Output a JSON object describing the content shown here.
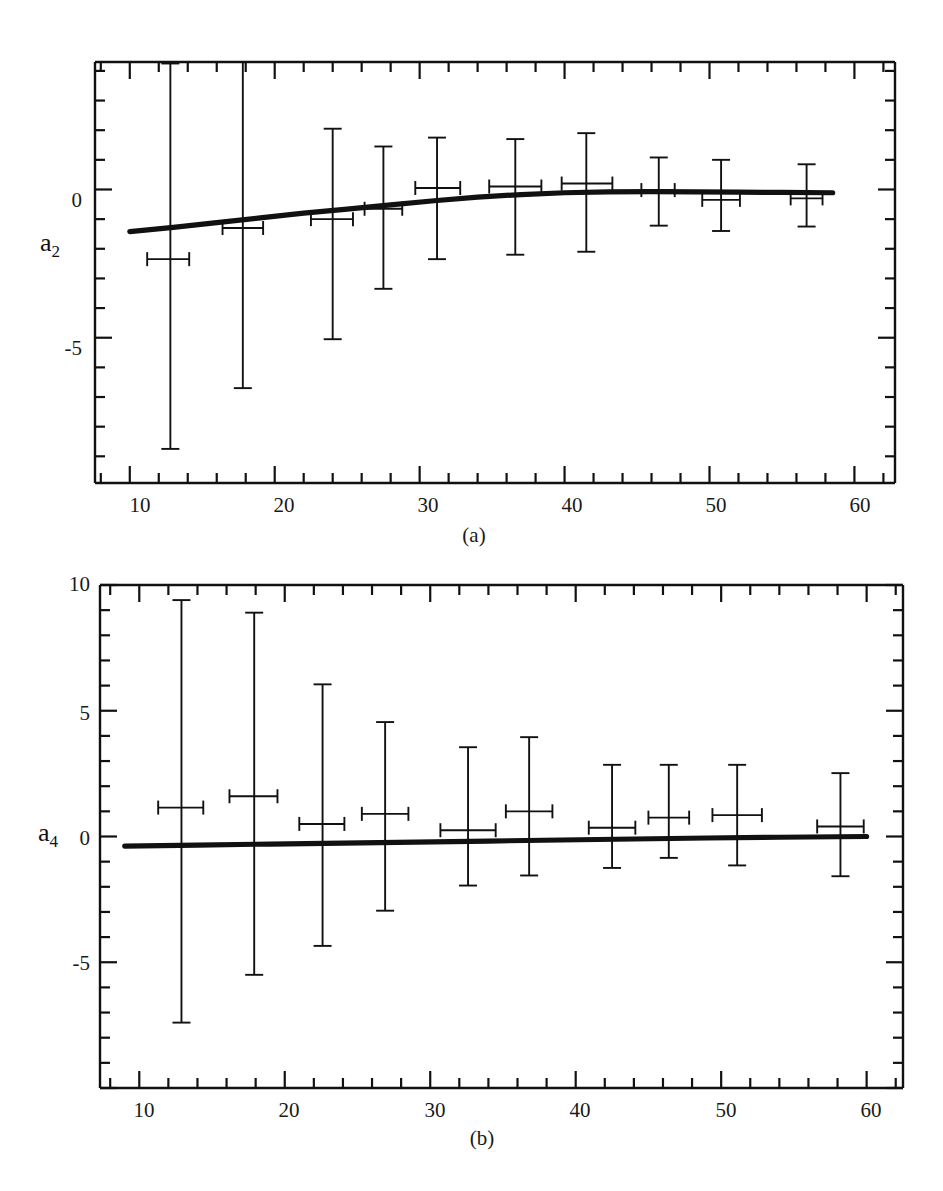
{
  "figure": {
    "background": "#ffffff",
    "ink": "#111111",
    "width": 943,
    "height": 1191
  },
  "panels": [
    {
      "id": "panel-a",
      "caption": "(a)",
      "ylabel": "a",
      "ylabel_sub": "2",
      "frame": {
        "left": 95,
        "top": 62,
        "right": 895,
        "bottom": 483
      },
      "x_axis": {
        "min": 7.6,
        "max": 62.8,
        "major_ticks": [
          10,
          20,
          30,
          40,
          50,
          60
        ],
        "major_tick_labels": [
          "10",
          "20",
          "30",
          "40",
          "50",
          "60"
        ],
        "minor_tick_step": 2
      },
      "y_axis": {
        "min": -9.9,
        "max": 4.3,
        "major_ticks": [
          0,
          -5
        ],
        "major_tick_labels": [
          "0",
          "-5"
        ],
        "minor_tick_step": 1
      }
    },
    {
      "id": "panel-b",
      "caption": "(b)",
      "ylabel": "a",
      "ylabel_sub": "4",
      "frame": {
        "left": 100,
        "top": 585,
        "right": 903,
        "bottom": 1088
      },
      "x_axis": {
        "min": 7.3,
        "max": 62.5,
        "major_ticks": [
          10,
          20,
          30,
          40,
          50,
          60
        ],
        "major_tick_labels": [
          "10",
          "20",
          "30",
          "40",
          "50",
          "60"
        ],
        "minor_tick_step": 2
      },
      "y_axis": {
        "min": -10.0,
        "max": 10.0,
        "major_ticks": [
          10,
          5,
          0,
          -5
        ],
        "major_tick_labels": [
          "10",
          "5",
          "0",
          "-5"
        ],
        "minor_tick_step": 1
      }
    }
  ],
  "chart_data": [
    {
      "type": "scatter",
      "id": "panel-a",
      "title": "",
      "subtitle": "(a)",
      "xlabel": "",
      "ylabel": "a2",
      "xlim": [
        7.6,
        62.8
      ],
      "ylim": [
        -9.9,
        4.3
      ],
      "grid": false,
      "legend": "none",
      "xticks": [
        10,
        20,
        30,
        40,
        50,
        60
      ],
      "yticks": [
        0,
        -5
      ],
      "series": [
        {
          "name": "measurements",
          "marker": "error-cross",
          "points": [
            {
              "x": 12.8,
              "y": -1.45,
              "xerr_lo": 1.6,
              "xerr_hi": 1.3,
              "yerr_lo": 7.3,
              "yerr_hi": 5.7,
              "xbar_y": -2.35
            },
            {
              "x": 17.8,
              "y": -1.2,
              "xerr_lo": 1.4,
              "xerr_hi": 1.4,
              "yerr_lo": 5.5,
              "yerr_hi": 5.5,
              "xbar_y": -1.3
            },
            {
              "x": 24.0,
              "y": -0.85,
              "xerr_lo": 1.5,
              "xerr_hi": 1.4,
              "yerr_lo": 4.2,
              "yerr_hi": 2.9,
              "xbar_y": -1.0
            },
            {
              "x": 27.5,
              "y": -0.55,
              "xerr_lo": 1.3,
              "xerr_hi": 1.3,
              "yerr_lo": 2.8,
              "yerr_hi": 2.0,
              "xbar_y": -0.65
            },
            {
              "x": 31.2,
              "y": 0.05,
              "xerr_lo": 1.5,
              "xerr_hi": 1.6,
              "yerr_lo": 2.4,
              "yerr_hi": 1.7,
              "xbar_y": 0.05
            },
            {
              "x": 36.6,
              "y": 0.1,
              "xerr_lo": 1.8,
              "xerr_hi": 1.8,
              "yerr_lo": 2.3,
              "yerr_hi": 1.6,
              "xbar_y": 0.1
            },
            {
              "x": 41.5,
              "y": 0.2,
              "xerr_lo": 1.7,
              "xerr_hi": 1.8,
              "yerr_lo": 2.3,
              "yerr_hi": 1.7,
              "xbar_y": 0.2
            },
            {
              "x": 46.5,
              "y": -0.02,
              "xerr_lo": 1.2,
              "xerr_hi": 1.1,
              "yerr_lo": 1.2,
              "yerr_hi": 1.1,
              "xbar_y": -0.02
            },
            {
              "x": 50.8,
              "y": -0.2,
              "xerr_lo": 1.3,
              "xerr_hi": 1.3,
              "yerr_lo": 1.2,
              "yerr_hi": 1.2,
              "xbar_y": -0.35
            },
            {
              "x": 56.7,
              "y": -0.15,
              "xerr_lo": 1.1,
              "xerr_hi": 1.1,
              "yerr_lo": 1.1,
              "yerr_hi": 1.0,
              "xbar_y": -0.3
            }
          ]
        },
        {
          "name": "model-fit",
          "marker": "thick-line",
          "x": [
            10.0,
            13.0,
            16.0,
            19.0,
            22.0,
            25.0,
            28.0,
            31.0,
            34.0,
            37.0,
            40.0,
            43.0,
            46.0,
            49.0,
            52.0,
            55.0,
            58.5
          ],
          "y": [
            -1.42,
            -1.28,
            -1.12,
            -0.96,
            -0.8,
            -0.66,
            -0.52,
            -0.38,
            -0.26,
            -0.17,
            -0.11,
            -0.08,
            -0.07,
            -0.08,
            -0.09,
            -0.1,
            -0.11
          ]
        }
      ]
    },
    {
      "type": "scatter",
      "id": "panel-b",
      "title": "",
      "subtitle": "(b)",
      "xlabel": "",
      "ylabel": "a4",
      "xlim": [
        7.3,
        62.5
      ],
      "ylim": [
        -10.0,
        10.0
      ],
      "grid": false,
      "legend": "none",
      "xticks": [
        10,
        20,
        30,
        40,
        50,
        60
      ],
      "yticks": [
        10,
        5,
        0,
        -5
      ],
      "series": [
        {
          "name": "measurements",
          "marker": "error-cross",
          "points": [
            {
              "x": 12.9,
              "y": 0.0,
              "xerr_lo": 1.6,
              "xerr_hi": 1.5,
              "yerr_lo": 7.4,
              "yerr_hi": 9.4,
              "xbar_y": 1.15
            },
            {
              "x": 17.9,
              "y": 0.0,
              "xerr_lo": 1.7,
              "xerr_hi": 1.6,
              "yerr_lo": 5.5,
              "yerr_hi": 8.9,
              "xbar_y": 1.6
            },
            {
              "x": 22.6,
              "y": 0.05,
              "xerr_lo": 1.6,
              "xerr_hi": 1.5,
              "yerr_lo": 4.4,
              "yerr_hi": 6.0,
              "xbar_y": 0.5
            },
            {
              "x": 26.9,
              "y": 0.05,
              "xerr_lo": 1.6,
              "xerr_hi": 1.6,
              "yerr_lo": 3.0,
              "yerr_hi": 4.5,
              "xbar_y": 0.9
            },
            {
              "x": 32.6,
              "y": 0.05,
              "xerr_lo": 1.9,
              "xerr_hi": 1.9,
              "yerr_lo": 2.0,
              "yerr_hi": 3.5,
              "xbar_y": 0.25
            },
            {
              "x": 36.8,
              "y": 0.05,
              "xerr_lo": 1.6,
              "xerr_hi": 1.6,
              "yerr_lo": 1.6,
              "yerr_hi": 3.9,
              "xbar_y": 1.0
            },
            {
              "x": 42.5,
              "y": 0.05,
              "xerr_lo": 1.6,
              "xerr_hi": 1.6,
              "yerr_lo": 1.3,
              "yerr_hi": 2.8,
              "xbar_y": 0.35
            },
            {
              "x": 46.4,
              "y": 0.05,
              "xerr_lo": 1.4,
              "xerr_hi": 1.4,
              "yerr_lo": 0.9,
              "yerr_hi": 2.8,
              "xbar_y": 0.75
            },
            {
              "x": 51.1,
              "y": 0.05,
              "xerr_lo": 1.7,
              "xerr_hi": 1.7,
              "yerr_lo": 1.2,
              "yerr_hi": 2.8,
              "xbar_y": 0.85
            },
            {
              "x": 58.2,
              "y": 0.02,
              "xerr_lo": 1.6,
              "xerr_hi": 1.6,
              "yerr_lo": 1.6,
              "yerr_hi": 2.5,
              "xbar_y": 0.4
            }
          ]
        },
        {
          "name": "model-fit",
          "marker": "thick-line",
          "x": [
            9.0,
            14.0,
            19.0,
            24.0,
            29.0,
            34.0,
            39.0,
            44.0,
            49.0,
            54.0,
            60.0
          ],
          "y": [
            -0.38,
            -0.34,
            -0.3,
            -0.26,
            -0.22,
            -0.18,
            -0.14,
            -0.1,
            -0.06,
            -0.03,
            0.0
          ]
        }
      ]
    }
  ]
}
